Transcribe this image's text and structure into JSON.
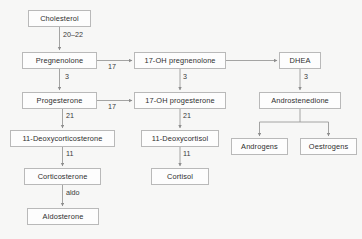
{
  "diagram": {
    "background_color": "#f7f7f6",
    "box_fill_color": "#fdfdfd",
    "box_border_color": "#b9b9b9",
    "line_color": "#9a9a9a",
    "text_color": "#2e2e2e"
  },
  "nodes": [
    {
      "id": "cholesterol",
      "label": "Cholesterol",
      "x": 28,
      "y": 10,
      "w": 63,
      "h": 17,
      "column": "left"
    },
    {
      "id": "pregnenolone",
      "label": "Pregnenolone",
      "x": 22,
      "y": 52,
      "w": 75,
      "h": 17,
      "column": "left"
    },
    {
      "id": "progesterone",
      "label": "Progesterone",
      "x": 22,
      "y": 92,
      "w": 75,
      "h": 17,
      "column": "left"
    },
    {
      "id": "11-deoxycorticosterone",
      "label": "11-Deoxycorticosterone",
      "x": 10,
      "y": 130,
      "w": 105,
      "h": 17,
      "column": "left"
    },
    {
      "id": "corticosterone",
      "label": "Corticosterone",
      "x": 24,
      "y": 168,
      "w": 77,
      "h": 17,
      "column": "left"
    },
    {
      "id": "aldosterone",
      "label": "Aldosterone",
      "x": 27,
      "y": 208,
      "w": 72,
      "h": 17,
      "column": "left"
    },
    {
      "id": "17-oh-pregnenolone",
      "label": "17-OH pregnenolone",
      "x": 134,
      "y": 52,
      "w": 92,
      "h": 17,
      "column": "middle"
    },
    {
      "id": "17-oh-progesterone",
      "label": "17-OH progesterone",
      "x": 134,
      "y": 92,
      "w": 92,
      "h": 17,
      "column": "middle"
    },
    {
      "id": "11-deoxycortisol",
      "label": "11-Deoxycortisol",
      "x": 141,
      "y": 130,
      "w": 78,
      "h": 17,
      "column": "middle"
    },
    {
      "id": "cortisol",
      "label": "Cortisol",
      "x": 151,
      "y": 168,
      "w": 58,
      "h": 17,
      "column": "middle"
    },
    {
      "id": "dhea",
      "label": "DHEA",
      "x": 279,
      "y": 52,
      "w": 42,
      "h": 17,
      "column": "right"
    },
    {
      "id": "androstenedione",
      "label": "Androstenedione",
      "x": 259,
      "y": 92,
      "w": 82,
      "h": 17,
      "column": "right"
    },
    {
      "id": "androgens",
      "label": "Androgens",
      "x": 231,
      "y": 138,
      "w": 57,
      "h": 17,
      "column": "right"
    },
    {
      "id": "oestrogens",
      "label": "Oestrogens",
      "x": 300,
      "y": 138,
      "w": 57,
      "h": 17,
      "column": "right"
    }
  ],
  "edges": [
    {
      "id": "e-chol-preg",
      "from": "cholesterol",
      "to": "pregnenolone",
      "enzyme": "20–22",
      "label_x": 63,
      "label_y": 34,
      "orientation": "vertical"
    },
    {
      "id": "e-preg-prog",
      "from": "pregnenolone",
      "to": "progesterone",
      "enzyme": "3",
      "label_x": 63,
      "label_y": 75,
      "orientation": "vertical"
    },
    {
      "id": "e-prog-dox",
      "from": "progesterone",
      "to": "11-deoxycorticosterone",
      "enzyme": "21",
      "label_x": 63,
      "label_y": 114,
      "orientation": "vertical"
    },
    {
      "id": "e-dox-cortico",
      "from": "11-deoxycorticosterone",
      "to": "corticosterone",
      "enzyme": "11",
      "label_x": 63,
      "label_y": 152,
      "orientation": "vertical"
    },
    {
      "id": "e-cortico-aldo",
      "from": "corticosterone",
      "to": "aldosterone",
      "enzyme": "aldo",
      "label_x": 63,
      "label_y": 191,
      "orientation": "vertical"
    },
    {
      "id": "e-preg-17ohpreg",
      "from": "pregnenolone",
      "to": "17-oh-pregnenolone",
      "enzyme": "17",
      "label_x": 110,
      "label_y": 64,
      "orientation": "horizontal"
    },
    {
      "id": "e-prog-17ohprog",
      "from": "progesterone",
      "to": "17-oh-progesterone",
      "enzyme": "17",
      "label_x": 110,
      "label_y": 104,
      "orientation": "horizontal"
    },
    {
      "id": "e-17ohpreg-17ohprog",
      "from": "17-oh-pregnenolone",
      "to": "17-oh-progesterone",
      "enzyme": "3",
      "label_x": 185,
      "label_y": 75,
      "orientation": "vertical"
    },
    {
      "id": "e-17ohprog-dcort",
      "from": "17-oh-progesterone",
      "to": "11-deoxycortisol",
      "enzyme": "21",
      "label_x": 185,
      "label_y": 114,
      "orientation": "vertical"
    },
    {
      "id": "e-dcort-cortisol",
      "from": "11-deoxycortisol",
      "to": "cortisol",
      "enzyme": "11",
      "label_x": 185,
      "label_y": 152,
      "orientation": "vertical"
    },
    {
      "id": "e-17ohpreg-dhea",
      "from": "17-oh-pregnenolone",
      "to": "dhea",
      "enzyme": "",
      "label_x": 0,
      "label_y": 0,
      "orientation": "horizontal"
    },
    {
      "id": "e-dhea-andro",
      "from": "dhea",
      "to": "androstenedione",
      "enzyme": "3",
      "label_x": 306,
      "label_y": 75,
      "orientation": "vertical"
    },
    {
      "id": "e-andro-androgens",
      "from": "androstenedione",
      "to": "androgens",
      "enzyme": "",
      "label_x": 0,
      "label_y": 0,
      "orientation": "branch"
    },
    {
      "id": "e-andro-oestrogens",
      "from": "androstenedione",
      "to": "oestrogens",
      "enzyme": "",
      "label_x": 0,
      "label_y": 0,
      "orientation": "branch"
    }
  ],
  "svg_paths": {
    "chol_preg": "M 59.5 27 L 59.5 51",
    "preg_prog": "M 59.5 69 L 59.5 91",
    "prog_dox": "M 62.5 109 L 62.5 129",
    "dox_cortico": "M 62.5 147 L 62.5 167",
    "cortico_aldo": "M 62.5 185 L 62.5 207",
    "preg_17ohpreg": "M 97 60.5 L 133 60.5",
    "prog_17ohprog": "M 97 100.5 L 133 100.5",
    "17ohpreg_17ohprog": "M 180 69 L 180 91",
    "17ohprog_dcort": "M 180 109 L 180 129",
    "dcort_cortisol": "M 180 147 L 180 167",
    "17ohpreg_dhea": "M 226 60.5 L 278 60.5",
    "dhea_andro": "M 300 69 L 300 91",
    "andro_branch": "M 300 109 L 300 122 M 259.5 122 L 340.5 122 M 259.5 122 L 259.5 137 M 328.5 122 L 328.5 137"
  }
}
